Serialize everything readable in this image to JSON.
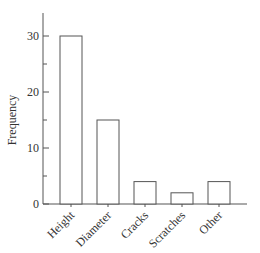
{
  "chart_data": {
    "type": "bar",
    "title": "",
    "xlabel": "",
    "ylabel": "Frequency",
    "categories": [
      "Height",
      "Diameter",
      "Cracks",
      "Scratches",
      "Other"
    ],
    "values": [
      30,
      15,
      4,
      2,
      4
    ],
    "ylim": [
      0,
      35
    ],
    "yticks": [
      0,
      10,
      20,
      30
    ],
    "yticks_minor": [
      5,
      15,
      25
    ],
    "grid": false,
    "legend": null,
    "bar_fill": "#ffffff",
    "bar_stroke": "#555555"
  },
  "yticklabels": [
    "0",
    "10",
    "20",
    "30"
  ]
}
